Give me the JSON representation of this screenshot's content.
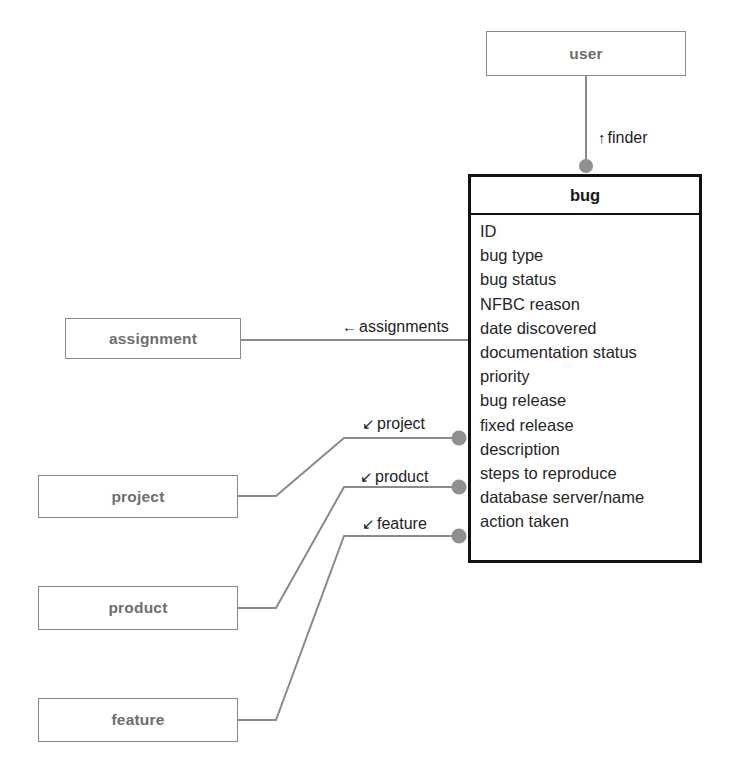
{
  "diagram": {
    "background_color": "#ffffff",
    "line_color": "#8a8a8a",
    "dot_color": "#8f8f8f",
    "main_border_color": "#111111",
    "simple_box_border_color": "#8a8a8a",
    "simple_box_text_color": "#6e6e6e"
  },
  "entities": {
    "user": {
      "name": "user",
      "x": 486,
      "y": 31,
      "w": 200,
      "h": 45
    },
    "assignment": {
      "name": "assignment",
      "x": 65,
      "y": 318,
      "w": 176,
      "h": 41
    },
    "project": {
      "name": "project",
      "x": 38,
      "y": 475,
      "w": 200,
      "h": 43
    },
    "product": {
      "name": "product",
      "x": 38,
      "y": 586,
      "w": 200,
      "h": 44
    },
    "feature": {
      "name": "feature",
      "x": 38,
      "y": 698,
      "w": 200,
      "h": 44
    },
    "bug": {
      "name": "bug",
      "x": 468,
      "y": 174,
      "w": 234,
      "h": 389,
      "attributes": [
        "ID",
        "bug type",
        "bug status",
        "NFBC reason",
        "date discovered",
        "documentation status",
        "priority",
        "bug release",
        "fixed release",
        "description",
        "steps to reproduce",
        "database server/name",
        "action taken"
      ]
    }
  },
  "relationships": [
    {
      "id": "finder",
      "label": "finder",
      "arrow": "↑",
      "from": "user",
      "to": "bug",
      "label_x": 596,
      "label_y": 129
    },
    {
      "id": "assignments",
      "label": "assignments",
      "arrow": "←",
      "from": "assignment",
      "to": "bug",
      "label_x": 340,
      "label_y": 318
    },
    {
      "id": "project",
      "label": "project",
      "arrow": "↙",
      "from": "project",
      "to": "bug",
      "label_x": 360,
      "label_y": 415
    },
    {
      "id": "product",
      "label": "product",
      "arrow": "↙",
      "from": "product",
      "to": "bug",
      "label_x": 358,
      "label_y": 468
    },
    {
      "id": "feature",
      "label": "feature",
      "arrow": "↙",
      "from": "feature",
      "to": "bug",
      "label_x": 360,
      "label_y": 515
    }
  ]
}
